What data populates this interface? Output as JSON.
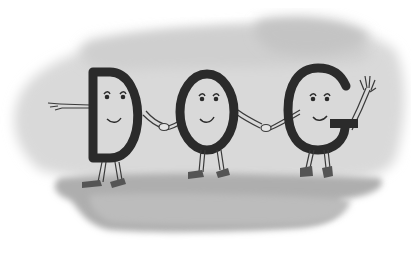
{
  "illustration": {
    "word": "DOG",
    "letters": [
      {
        "char": "D",
        "expression": "smile",
        "pose": "pointing left"
      },
      {
        "char": "O",
        "expression": "smile",
        "pose": "holding hands"
      },
      {
        "char": "G",
        "expression": "smile",
        "pose": "waving"
      }
    ],
    "style": "grayscale pencil drawing on watercolor wash",
    "colors": {
      "ink": "#2b2b2b",
      "wash_light": "#d6d6d6",
      "wash_dark": "#a9a9a9",
      "background": "#ffffff"
    }
  }
}
